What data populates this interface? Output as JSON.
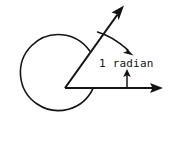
{
  "figure": {
    "background_color": "#ffffff",
    "ink_color": "#141414",
    "width": 172,
    "height": 152,
    "angle_label": "1 radian",
    "edge_fragment": "",
    "center": {
      "x": 55,
      "y": 83
    },
    "radius": 38,
    "rays": [
      {
        "name": "initial-side",
        "angle_deg": 0,
        "tip": {
          "x": 160,
          "y": 88
        }
      },
      {
        "name": "terminal-side",
        "angle_deg": 57.3,
        "tip": {
          "x": 124,
          "y": 7
        }
      }
    ],
    "arc_sweep_deg": 57.3,
    "icons": {
      "ray_arrowhead": "arrowhead-icon",
      "curved_arrow": "curved-arrow-icon",
      "pointer_tick": "up-pointer-icon"
    }
  }
}
